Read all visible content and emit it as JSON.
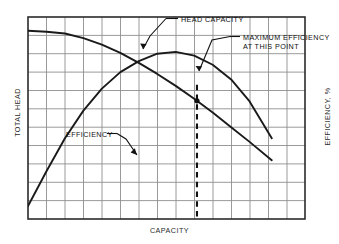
{
  "figure": {
    "axes": {
      "left_label": "TOTAL HEAD",
      "right_label": "EFFICIENCY, %",
      "bottom_label": "CAPACITY"
    },
    "annotations": {
      "head_capacity": "HEAD CAPACITY",
      "max_efficiency_line1": "MAXIMUM EFFICIENCY",
      "max_efficiency_line2": "AT THIS POINT",
      "efficiency": "EFFICIENCY"
    },
    "colors": {
      "curve": "#1a1a1a",
      "grid": "#8c8c8c",
      "frame": "#2b2b2b",
      "background": "#ffffff",
      "marker": "#111111"
    }
  },
  "chart_data": {
    "type": "line",
    "title": "",
    "xlabel": "CAPACITY",
    "ylabel": "TOTAL HEAD",
    "y2label": "EFFICIENCY, %",
    "grid": true,
    "legend": "none",
    "xlim": [
      0,
      15
    ],
    "ylim": [
      0,
      11
    ],
    "grid_columns": 15,
    "grid_rows": 11,
    "series": [
      {
        "name": "HEAD CAPACITY",
        "axis": "left",
        "x": [
          0,
          1.0,
          2.0,
          3.0,
          4.0,
          5.0,
          6.0,
          7.0,
          8.0,
          9.0,
          10.0,
          11.0,
          12.0,
          13.2
        ],
        "y": [
          10.25,
          10.2,
          10.1,
          9.85,
          9.5,
          9.05,
          8.5,
          7.9,
          7.25,
          6.55,
          5.8,
          5.0,
          4.2,
          3.2
        ]
      },
      {
        "name": "EFFICIENCY",
        "axis": "right",
        "x": [
          0,
          1.0,
          2.0,
          3.0,
          4.0,
          5.0,
          6.0,
          7.0,
          8.0,
          9.0,
          10.0,
          11.0,
          12.0,
          13.2
        ],
        "y": [
          0.35,
          1.3,
          2.2,
          2.95,
          3.55,
          4.0,
          4.3,
          4.5,
          4.55,
          4.45,
          4.2,
          3.8,
          3.2,
          2.2
        ]
      }
    ],
    "annotations": [
      {
        "name": "head-capacity-callout",
        "text": "HEAD CAPACITY",
        "points_to_x": 6.1,
        "points_to_y_series": "HEAD CAPACITY"
      },
      {
        "name": "maximum-efficiency-callout",
        "text": "MAXIMUM EFFICIENCY AT THIS POINT",
        "points_to_x": 9.15,
        "marker": true
      },
      {
        "name": "efficiency-callout",
        "text": "EFFICIENCY",
        "points_to_x": 5.5,
        "points_to_y_series": "EFFICIENCY"
      },
      {
        "name": "best-efficiency-point-line",
        "type": "vertical-dashed",
        "x": 9.15
      }
    ]
  }
}
